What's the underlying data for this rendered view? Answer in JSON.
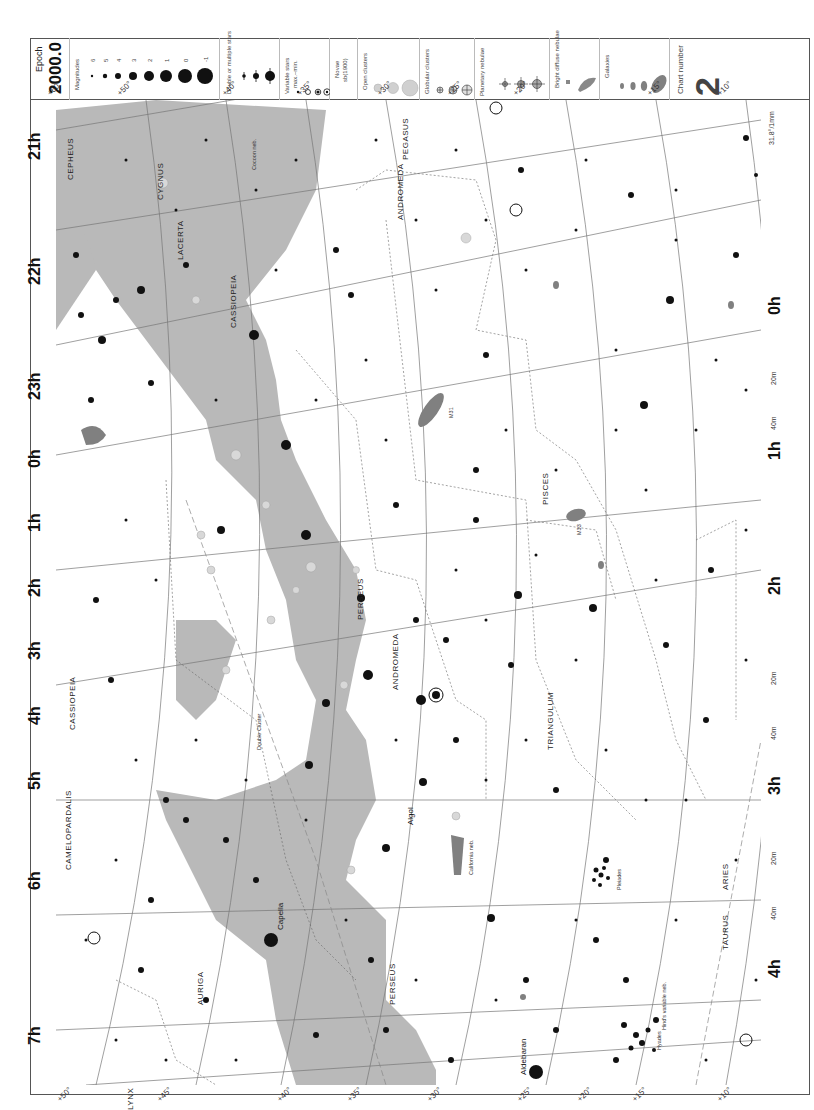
{
  "legend": {
    "epoch_label": "Epoch",
    "epoch_value": "2000.0",
    "magnitudes_title": "Magnitudes",
    "magnitudes": [
      "6",
      "5",
      "4",
      "3",
      "2",
      "1",
      "0",
      "-1"
    ],
    "double_stars_title": "Double or multiple stars",
    "variable_stars_title": "Variable stars",
    "variable_stars_subtitle": "max.–min.",
    "variable_ranges": [
      "8 – < 8",
      "6 – < 6",
      "4 – 5",
      "3 – 6"
    ],
    "novae_title": "Novae",
    "novae_subtitle": "sb(1900)",
    "open_clusters_title": "Open clusters",
    "open_clusters": [
      "< 30'",
      "> 30' drawn to scale"
    ],
    "globular_clusters_title": "Globular clusters",
    "globular_clusters": [
      "< 5'",
      "5'– 10'",
      "> 10'"
    ],
    "planetary_nebulae_title": "Planetary nebulae",
    "planetary_nebulae": [
      "< 30\"",
      "30\"– 60\"",
      "> 60\""
    ],
    "bright_diffuse_title": "Bright diffuse nebulae",
    "bright_diffuse": [
      "< 10'",
      "> 10' drawn to scale"
    ],
    "galaxies_title": "Galaxies",
    "galaxies": [
      "< 10'",
      "10'– 20'",
      "20'– 30'",
      "> 30' drawn to scale"
    ],
    "chart_number_label": "Chart number",
    "chart_number": "2"
  },
  "map": {
    "ra_labels": [
      "21h",
      "22h",
      "23h",
      "0h",
      "1h",
      "2h",
      "3h",
      "4h",
      "5h",
      "6h",
      "7h"
    ],
    "ra_labels_right": [
      "0h",
      "1h",
      "2h",
      "3h",
      "4h"
    ],
    "ra_minutes": [
      "20m",
      "40m"
    ],
    "dec_labels_top": [
      "+60°",
      "+50°",
      "+40°",
      "+35°",
      "+30°",
      "+25°",
      "+20°",
      "+15°",
      "+10°"
    ],
    "dec_labels_bottom": [
      "+50°",
      "+45°",
      "+40°",
      "+35°",
      "+30°",
      "+25°",
      "+20°",
      "+15°",
      "+10°"
    ],
    "dec_labels_left": [
      "+60°",
      "+70°",
      "+80°",
      "+70°",
      "+60°"
    ],
    "corner_note": "31.8°/1mm",
    "constellations": [
      "CEPHEUS",
      "CYGNUS",
      "LACERTA",
      "CASSIOPEIA",
      "PEGASUS",
      "ANDROMEDA",
      "PISCES",
      "PERSEUS",
      "TRIANGULUM",
      "ARIES",
      "TAURUS",
      "AURIGA",
      "CAMELOPARDALIS",
      "LYNX"
    ],
    "named_objects": [
      "Algol",
      "Capella",
      "Aldebaran",
      "Pleiades",
      "Hyades",
      "Double Cluster",
      "California neb.",
      "Cocoon neb.",
      "Hind's variable neb.",
      "M31",
      "M33",
      "M34",
      "M45",
      "M76",
      "M103",
      "M52",
      "NGC 752",
      "NGC 7662",
      "NGC 7789"
    ],
    "colors": {
      "milky_way": "#b9b9b9",
      "grid": "#777777",
      "boundary": "#666666",
      "star": "#111111",
      "galaxy": "#808080",
      "cluster": "#d0d0d0"
    }
  }
}
